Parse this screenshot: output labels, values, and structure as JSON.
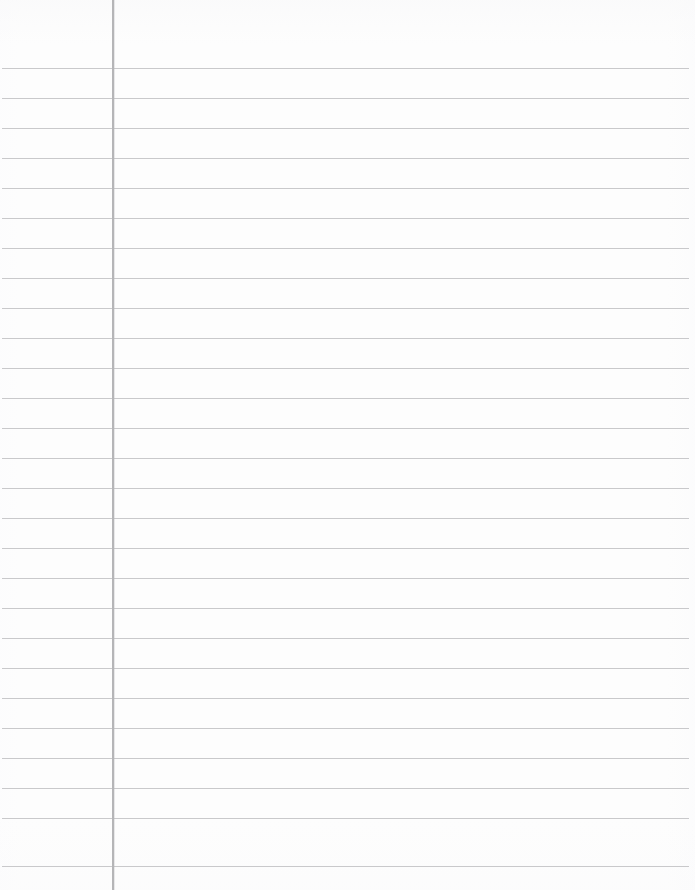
{
  "document": {
    "type": "lined-notebook-paper",
    "title": "Ruled Notebook Paper",
    "orientation": "portrait",
    "page_width": 695,
    "page_height": 890,
    "content_text": "",
    "is_blank": true
  },
  "paper": {
    "background_color": "#fdfdfd",
    "edge_tone_color": "#f8f8f9"
  },
  "margin_rule": {
    "name": "vertical-margin-line",
    "x": 112,
    "top": 0,
    "height": 890,
    "color": "#b5b5b7",
    "thickness": 1.5
  },
  "ruling": {
    "name": "horizontal-rule-lines",
    "color": "#c9c9cb",
    "thickness": 1,
    "spacing": 30,
    "first_line_y": 68,
    "last_line_y": 866,
    "line_start_x": 2,
    "line_end_x": 689,
    "count": 27,
    "line_positions": [
      68,
      98,
      128,
      158,
      188,
      218,
      248,
      278,
      308,
      338,
      368,
      398,
      428,
      458,
      488,
      518,
      548,
      578,
      608,
      638,
      668,
      698,
      728,
      758,
      788,
      818,
      866
    ]
  }
}
